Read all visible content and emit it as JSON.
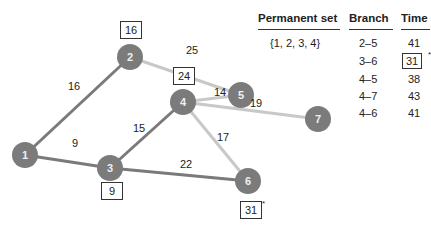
{
  "graph": {
    "nodes": [
      {
        "id": "1",
        "x": 25,
        "y": 155
      },
      {
        "id": "2",
        "x": 130,
        "y": 57
      },
      {
        "id": "3",
        "x": 110,
        "y": 168
      },
      {
        "id": "4",
        "x": 183,
        "y": 102
      },
      {
        "id": "5",
        "x": 241,
        "y": 95
      },
      {
        "id": "6",
        "x": 248,
        "y": 181
      },
      {
        "id": "7",
        "x": 318,
        "y": 119
      }
    ],
    "edges": [
      {
        "from": "1",
        "to": "2",
        "weight": "16",
        "type": "permanent"
      },
      {
        "from": "1",
        "to": "3",
        "weight": "9",
        "type": "permanent"
      },
      {
        "from": "3",
        "to": "4",
        "weight": "15",
        "type": "permanent"
      },
      {
        "from": "3",
        "to": "6",
        "weight": "22",
        "type": "permanent"
      },
      {
        "from": "2",
        "to": "5",
        "weight": "25",
        "type": "candidate"
      },
      {
        "from": "4",
        "to": "5",
        "weight": "14",
        "type": "candidate"
      },
      {
        "from": "4",
        "to": "7",
        "weight": "19",
        "type": "candidate"
      },
      {
        "from": "4",
        "to": "6",
        "weight": "17",
        "type": "candidate"
      }
    ],
    "edge_labels": {
      "e12": "16",
      "e13": "9",
      "e34": "15",
      "e36": "22",
      "e25": "25",
      "e45": "14",
      "e47": "19",
      "e46": "17"
    },
    "distance_boxes": {
      "node2": "16",
      "node3": "9",
      "node4": "24",
      "node6": "31"
    },
    "node6_marker": "*",
    "colors": {
      "node_fill": "#7b7b7b",
      "permanent_edge": "#7a7a7a",
      "candidate_edge": "#c8c8c8"
    }
  },
  "table": {
    "headers": {
      "permanent_set": "Permanent set",
      "branch": "Branch",
      "time": "Time"
    },
    "permanent_set": "{1, 2, 3, 4}",
    "rows": [
      {
        "branch": "2–5",
        "time": "41"
      },
      {
        "branch": "3–6",
        "time": "31",
        "selected": true,
        "marker": "*"
      },
      {
        "branch": "4–5",
        "time": "38"
      },
      {
        "branch": "4–7",
        "time": "43"
      },
      {
        "branch": "4–6",
        "time": "41"
      }
    ]
  }
}
